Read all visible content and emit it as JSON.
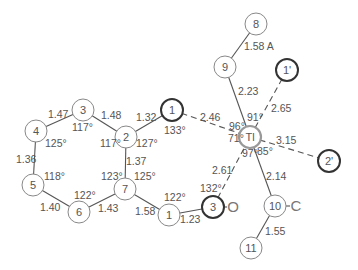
{
  "diagram": {
    "atoms": [
      {
        "id": "O8",
        "label": "8",
        "style": "normal"
      },
      {
        "id": "N9",
        "label": "9",
        "style": "normal"
      },
      {
        "id": "O1p",
        "label": "1'",
        "style": "heavy"
      },
      {
        "id": "Tl",
        "label": "Tl",
        "style": "metal"
      },
      {
        "id": "O2p",
        "label": "2'",
        "style": "heavy"
      },
      {
        "id": "O1a",
        "label": "1",
        "style": "heavy"
      },
      {
        "id": "C2",
        "label": "2",
        "style": "normal"
      },
      {
        "id": "C3",
        "label": "3",
        "style": "normal"
      },
      {
        "id": "C4",
        "label": "4",
        "style": "normal"
      },
      {
        "id": "C5",
        "label": "5",
        "style": "normal"
      },
      {
        "id": "C6",
        "label": "6",
        "style": "normal"
      },
      {
        "id": "C7",
        "label": "7",
        "style": "normal"
      },
      {
        "id": "C1b",
        "label": "1",
        "style": "normal"
      },
      {
        "id": "O3",
        "label": "3",
        "style": "heavy"
      },
      {
        "id": "C10",
        "label": "10",
        "style": "normal"
      },
      {
        "id": "C11",
        "label": "11",
        "style": "normal"
      }
    ],
    "substituents": [
      {
        "attached_to": "O3",
        "label": "O"
      },
      {
        "attached_to": "C10",
        "label": "C"
      }
    ],
    "bonds": [
      {
        "from": "O8",
        "to": "N9",
        "type": "solid",
        "length": "1.58 A"
      },
      {
        "from": "N9",
        "to": "Tl",
        "type": "solid",
        "length": "2.23"
      },
      {
        "from": "O1p",
        "to": "Tl",
        "type": "dashed",
        "length": "2.65"
      },
      {
        "from": "O1a",
        "to": "Tl",
        "type": "dashed",
        "length": "2.46"
      },
      {
        "from": "Tl",
        "to": "O2p",
        "type": "dashed",
        "length": "3.15"
      },
      {
        "from": "O3",
        "to": "Tl",
        "type": "dashed",
        "length": "2.61"
      },
      {
        "from": "Tl",
        "to": "C10",
        "type": "solid",
        "length": "2.14"
      },
      {
        "from": "C10",
        "to": "C11",
        "type": "solid",
        "length": "1.55"
      },
      {
        "from": "C2",
        "to": "O1a",
        "type": "solid",
        "length": "1.32"
      },
      {
        "from": "C3",
        "to": "C2",
        "type": "solid",
        "length": "1.48"
      },
      {
        "from": "C4",
        "to": "C3",
        "type": "solid",
        "length": "1.47"
      },
      {
        "from": "C4",
        "to": "C5",
        "type": "solid",
        "length": "1.36"
      },
      {
        "from": "C5",
        "to": "C6",
        "type": "solid",
        "length": "1.40"
      },
      {
        "from": "C6",
        "to": "C7",
        "type": "solid",
        "length": "1.43"
      },
      {
        "from": "C2",
        "to": "C7",
        "type": "solid",
        "length": "1.37"
      },
      {
        "from": "C7",
        "to": "C1b",
        "type": "solid",
        "length": "1.58"
      },
      {
        "from": "C1b",
        "to": "O3",
        "type": "solid",
        "length": "1.23"
      }
    ],
    "angles": [
      {
        "at": "O1a",
        "value": "133°"
      },
      {
        "at": "C2",
        "value": "117°",
        "side": "left"
      },
      {
        "at": "C2",
        "value": "127°",
        "side": "right"
      },
      {
        "at": "C3",
        "value": "117°"
      },
      {
        "at": "C4",
        "value": "125°"
      },
      {
        "at": "C5",
        "value": "118°"
      },
      {
        "at": "C6",
        "value": "122°"
      },
      {
        "at": "C7",
        "value": "123°",
        "side": "left"
      },
      {
        "at": "C7",
        "value": "125°",
        "side": "right"
      },
      {
        "at": "C1b",
        "value": "122°"
      },
      {
        "at": "O3",
        "value": "132°"
      },
      {
        "at": "Tl",
        "value": "96°",
        "side": "upper-left"
      },
      {
        "at": "Tl",
        "value": "91°",
        "side": "upper-right"
      },
      {
        "at": "Tl",
        "value": "71°",
        "side": "left"
      },
      {
        "at": "Tl",
        "value": "97°",
        "side": "lower-left"
      },
      {
        "at": "Tl",
        "value": "85°",
        "side": "lower-right"
      }
    ]
  }
}
